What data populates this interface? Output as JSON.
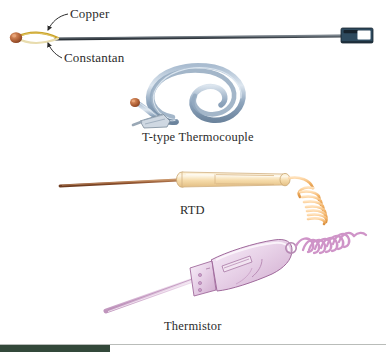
{
  "figure": {
    "background_color": "#ffffff",
    "labels": {
      "copper": "Copper",
      "constantan": "Constantan"
    },
    "captions": {
      "thermocouple": "T-type Thermocouple",
      "rtd": "RTD",
      "thermistor": "Thermistor"
    },
    "items": [
      {
        "name": "t-type-thermocouple",
        "caption": "T-type Thermocouple",
        "callouts": [
          "Copper",
          "Constantan"
        ],
        "colors": {
          "bead": "#b5663a",
          "copper_wire": "#c9a227",
          "constantan_wire": "#e8dcae",
          "sheath": "#3c4349",
          "connector_body": "#2e4a5e",
          "connector_window": "#ffffff",
          "cable": "#7f95ad"
        }
      },
      {
        "name": "rtd",
        "caption": "RTD",
        "colors": {
          "probe_shaft": "#9b5a33",
          "handle": "#f6dfae",
          "handle_highlight": "#fdf3dd",
          "cord": "#f0b060"
        }
      },
      {
        "name": "thermistor",
        "caption": "Thermistor",
        "colors": {
          "probe_shaft": "#d9b9d6",
          "body": "#e6cfe4",
          "body_highlight": "#f6ecf5",
          "outline": "#a06a9c",
          "cord": "#c98cc2"
        }
      }
    ],
    "footer": {
      "rule_color": "#b9bcb9",
      "accent_bar_color": "#33483a"
    }
  }
}
